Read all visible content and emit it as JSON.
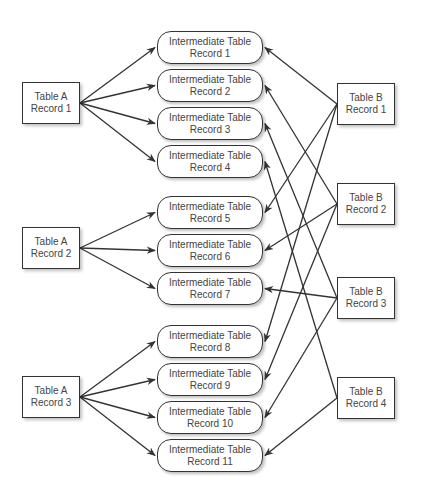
{
  "diagram": {
    "type": "many-to-many relationship via intermediate table",
    "colors": {
      "line": "#333333",
      "text": "#444444",
      "background": "#ffffff"
    },
    "table_a": [
      {
        "id": "A1",
        "line1": "Table A",
        "line2": "Record 1",
        "x": 22,
        "y": 82
      },
      {
        "id": "A2",
        "line1": "Table A",
        "line2": "Record 2",
        "x": 22,
        "y": 227
      },
      {
        "id": "A3",
        "line1": "Table A",
        "line2": "Record 3",
        "x": 22,
        "y": 376
      }
    ],
    "intermediate": [
      {
        "id": "I1",
        "line1": "Intermediate Table",
        "line2": "Record 1",
        "x": 157,
        "y": 31
      },
      {
        "id": "I2",
        "line1": "Intermediate Table",
        "line2": "Record 2",
        "x": 157,
        "y": 69
      },
      {
        "id": "I3",
        "line1": "Intermediate Table",
        "line2": "Record 3",
        "x": 157,
        "y": 107
      },
      {
        "id": "I4",
        "line1": "Intermediate Table",
        "line2": "Record 4",
        "x": 157,
        "y": 145
      },
      {
        "id": "I5",
        "line1": "Intermediate Table",
        "line2": "Record 5",
        "x": 157,
        "y": 196
      },
      {
        "id": "I6",
        "line1": "Intermediate Table",
        "line2": "Record 6",
        "x": 157,
        "y": 234
      },
      {
        "id": "I7",
        "line1": "Intermediate Table",
        "line2": "Record 7",
        "x": 157,
        "y": 272
      },
      {
        "id": "I8",
        "line1": "Intermediate Table",
        "line2": "Record 8",
        "x": 157,
        "y": 325
      },
      {
        "id": "I9",
        "line1": "Intermediate Table",
        "line2": "Record 9",
        "x": 157,
        "y": 363
      },
      {
        "id": "I10",
        "line1": "Intermediate Table",
        "line2": "Record 10",
        "x": 157,
        "y": 401
      },
      {
        "id": "I11",
        "line1": "Intermediate Table",
        "line2": "Record 11",
        "x": 157,
        "y": 439
      }
    ],
    "table_b": [
      {
        "id": "B1",
        "line1": "Table B",
        "line2": "Record 1",
        "x": 337,
        "y": 83
      },
      {
        "id": "B2",
        "line1": "Table B",
        "line2": "Record 2",
        "x": 337,
        "y": 183
      },
      {
        "id": "B3",
        "line1": "Table B",
        "line2": "Record 3",
        "x": 337,
        "y": 277
      },
      {
        "id": "B4",
        "line1": "Table B",
        "line2": "Record 4",
        "x": 337,
        "y": 377
      }
    ],
    "edges": [
      {
        "from": "A1",
        "to": "I1"
      },
      {
        "from": "A1",
        "to": "I2"
      },
      {
        "from": "A1",
        "to": "I3"
      },
      {
        "from": "A1",
        "to": "I4"
      },
      {
        "from": "A2",
        "to": "I5"
      },
      {
        "from": "A2",
        "to": "I6"
      },
      {
        "from": "A2",
        "to": "I7"
      },
      {
        "from": "A3",
        "to": "I8"
      },
      {
        "from": "A3",
        "to": "I9"
      },
      {
        "from": "A3",
        "to": "I10"
      },
      {
        "from": "A3",
        "to": "I11"
      },
      {
        "from": "B1",
        "to": "I1"
      },
      {
        "from": "B1",
        "to": "I5"
      },
      {
        "from": "B1",
        "to": "I8"
      },
      {
        "from": "B2",
        "to": "I2"
      },
      {
        "from": "B2",
        "to": "I6"
      },
      {
        "from": "B2",
        "to": "I9"
      },
      {
        "from": "B3",
        "to": "I3"
      },
      {
        "from": "B3",
        "to": "I7"
      },
      {
        "from": "B3",
        "to": "I10"
      },
      {
        "from": "B4",
        "to": "I4"
      },
      {
        "from": "B4",
        "to": "I11"
      }
    ]
  }
}
